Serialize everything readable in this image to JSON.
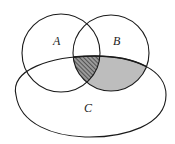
{
  "diagram": {
    "type": "venn",
    "sets": [
      {
        "id": "A",
        "label": "A"
      },
      {
        "id": "B",
        "label": "B"
      },
      {
        "id": "C",
        "label": "C"
      }
    ],
    "regions": [
      {
        "name": "A∩B∩C",
        "fill": "hatched"
      },
      {
        "name": "B∩C minus A",
        "fill": "shaded"
      }
    ],
    "colors": {
      "stroke": "#1a1a1a",
      "shade": "#bdbdbd",
      "hatch": "#333333",
      "background": "#ffffff"
    }
  }
}
